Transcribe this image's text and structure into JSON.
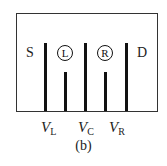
{
  "diagram": {
    "caption": "(b)",
    "leads": {
      "source": "S",
      "drain": "D"
    },
    "dots": [
      {
        "label": "L"
      },
      {
        "label": "R"
      }
    ],
    "gates": [
      {
        "symbol": "V",
        "subscript": "L"
      },
      {
        "symbol": "V",
        "subscript": "C"
      },
      {
        "symbol": "V",
        "subscript": "R"
      }
    ],
    "colors": {
      "lines": "#111111",
      "background": "#ffffff"
    }
  }
}
